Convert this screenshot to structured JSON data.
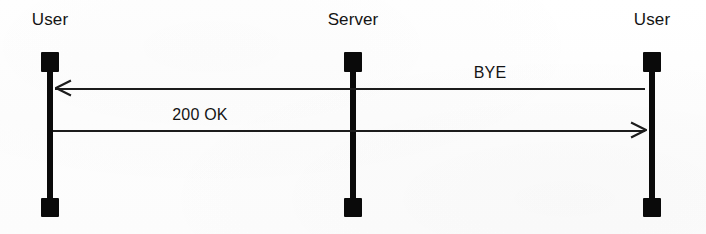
{
  "diagram": {
    "type": "sequence-diagram",
    "background_color": "#fefefe",
    "stroke_color": "#0a0a0a",
    "text_color": "#141414",
    "width": 706,
    "height": 234,
    "lifelines": [
      {
        "id": "user-left",
        "label": "User",
        "x": 50,
        "head_top": 52,
        "foot_top": 198
      },
      {
        "id": "server",
        "label": "Server",
        "x": 353,
        "head_top": 52,
        "foot_top": 198
      },
      {
        "id": "user-right",
        "label": "User",
        "x": 652,
        "head_top": 52,
        "foot_top": 198
      }
    ],
    "messages": [
      {
        "id": "bye",
        "label": "BYE",
        "from": "user-right",
        "to": "user-left",
        "direction": "left",
        "y": 88,
        "from_x": 645,
        "to_x": 55,
        "label_x": 490
      },
      {
        "id": "ok-200",
        "label": "200 OK",
        "from": "user-left",
        "to": "user-right",
        "direction": "right",
        "y": 130,
        "from_x": 53,
        "to_x": 645,
        "label_x": 200
      }
    ]
  }
}
